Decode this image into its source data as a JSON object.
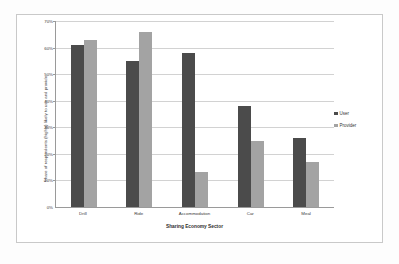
{
  "chart_data": {
    "type": "bar",
    "title": "",
    "xlabel": "Sharing Economy Sector",
    "ylabel": "Share of respondents (highly) likely to use and provide",
    "categories": [
      "Drill",
      "Ride",
      "Accommodation",
      "Car",
      "Meal"
    ],
    "series": [
      {
        "name": "User",
        "color": "#4b4b4b",
        "values": [
          61,
          55,
          58,
          38,
          26
        ]
      },
      {
        "name": "Provider",
        "color": "#a3a3a3",
        "values": [
          63,
          66,
          13,
          25,
          17
        ]
      }
    ],
    "ylim": [
      0,
      70
    ],
    "ytick_values": [
      0,
      10,
      20,
      30,
      40,
      50,
      60,
      70
    ],
    "ytick_labels": [
      "0%",
      "10%",
      "20%",
      "30%",
      "40%",
      "50%",
      "60%",
      "70%"
    ],
    "grid": true,
    "legend_position": "right"
  },
  "legend": {
    "entries": [
      {
        "label": "User"
      },
      {
        "label": "Provider"
      }
    ]
  }
}
